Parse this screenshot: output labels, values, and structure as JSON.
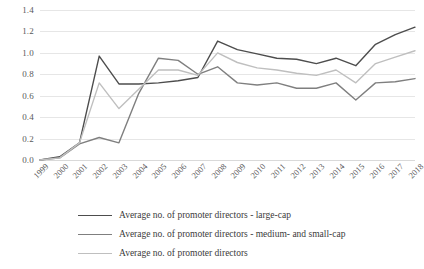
{
  "chart_data": {
    "type": "line",
    "title": "",
    "xlabel": "",
    "ylabel": "",
    "grid": true,
    "legend_position": "bottom",
    "ylim": [
      0.0,
      1.4
    ],
    "yticks": [
      "0.0",
      "0.2",
      "0.4",
      "0.6",
      "0.8",
      "1.0",
      "1.2",
      "1.4"
    ],
    "ytick_values": [
      0.0,
      0.2,
      0.4,
      0.6,
      0.8,
      1.0,
      1.2,
      1.4
    ],
    "categories": [
      "1999",
      "2000",
      "2001",
      "2002",
      "2003",
      "2004",
      "2005",
      "2006",
      "2007",
      "2008",
      "2009",
      "2010",
      "2011",
      "2012",
      "2013",
      "2014",
      "2015",
      "2016",
      "2017",
      "2018"
    ],
    "series": [
      {
        "name": "Average no. of promoter directors - large-cap",
        "color": "#4d4d4d",
        "values": [
          0.0,
          0.03,
          0.16,
          0.97,
          0.71,
          0.71,
          0.72,
          0.74,
          0.77,
          1.11,
          1.03,
          0.99,
          0.95,
          0.94,
          0.9,
          0.95,
          0.88,
          1.08,
          1.17,
          1.24
        ]
      },
      {
        "name": "Average no. of promoter directors - medium- and small-cap",
        "color": "#7f7f7f",
        "values": [
          0.0,
          0.02,
          0.15,
          0.21,
          0.16,
          0.62,
          0.95,
          0.93,
          0.8,
          0.87,
          0.72,
          0.7,
          0.72,
          0.67,
          0.67,
          0.72,
          0.56,
          0.72,
          0.73,
          0.76
        ]
      },
      {
        "name": "Average no. of promoter directors",
        "color": "#bfbfbf",
        "values": [
          0.0,
          0.02,
          0.16,
          0.72,
          0.48,
          0.66,
          0.84,
          0.84,
          0.79,
          1.0,
          0.91,
          0.86,
          0.84,
          0.81,
          0.79,
          0.84,
          0.72,
          0.9,
          0.96,
          1.02
        ]
      }
    ]
  }
}
